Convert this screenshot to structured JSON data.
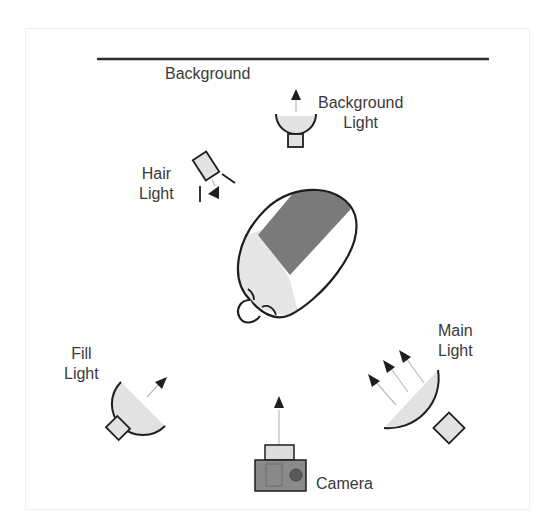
{
  "diagram": {
    "labels": {
      "background": "Background",
      "background_light_line1": "Background",
      "background_light_line2": "Light",
      "hair_light_line1": "Hair",
      "hair_light_line2": "Light",
      "fill_light_line1": "Fill",
      "fill_light_line2": "Light",
      "main_light_line1": "Main",
      "main_light_line2": "Light",
      "camera": "Camera"
    },
    "elements": [
      {
        "id": "background",
        "type": "line"
      },
      {
        "id": "background-light",
        "type": "light",
        "direction": "up (toward background)"
      },
      {
        "id": "hair-light",
        "type": "light",
        "direction": "down-right (toward subject)"
      },
      {
        "id": "subject",
        "type": "head-top-view"
      },
      {
        "id": "fill-light",
        "type": "light",
        "direction": "up-right"
      },
      {
        "id": "main-light",
        "type": "light",
        "direction": "up-left",
        "arrows": 3
      },
      {
        "id": "camera",
        "type": "camera",
        "direction": "up"
      }
    ],
    "colors": {
      "stroke": "#1e1e1e",
      "light_fill": "#e2e2e2",
      "subject_shadow": "#7a7a7a",
      "subject_light": "#e6e6e6",
      "camera_body": "#8a8a8a",
      "camera_top": "#dcdcdc",
      "text": "#3a3a3a"
    }
  }
}
